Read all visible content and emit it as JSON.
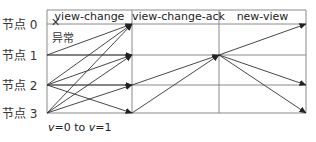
{
  "diagram": {
    "type": "pbft-view-change-sequence",
    "phases": [
      {
        "label": "view-change",
        "x_start": 47,
        "x_end": 132
      },
      {
        "label": "view-change-ack",
        "x_start": 132,
        "x_end": 219
      },
      {
        "label": "new-view",
        "x_start": 219,
        "x_end": 306
      }
    ],
    "nodes": [
      {
        "label": "节点 0",
        "y": 24,
        "faulty": true
      },
      {
        "label": "节点 1",
        "y": 55,
        "faulty": false
      },
      {
        "label": "节点 2",
        "y": 85,
        "faulty": false
      },
      {
        "label": "节点 3",
        "y": 113,
        "faulty": false
      }
    ],
    "fault_mark": "✕",
    "fault_label": "异常",
    "footer": {
      "v_from_var": "v",
      "v_from": "=0",
      "to": "to",
      "v_to_var": "v",
      "v_to": "=1"
    },
    "messages": [
      {
        "phase": "view-change",
        "from": 1,
        "to": 0
      },
      {
        "phase": "view-change",
        "from": 1,
        "to": 1
      },
      {
        "phase": "view-change",
        "from": 2,
        "to": 0
      },
      {
        "phase": "view-change",
        "from": 2,
        "to": 1
      },
      {
        "phase": "view-change",
        "from": 2,
        "to": 2
      },
      {
        "phase": "view-change",
        "from": 2,
        "to": 3
      },
      {
        "phase": "view-change",
        "from": 3,
        "to": 0
      },
      {
        "phase": "view-change",
        "from": 3,
        "to": 1
      },
      {
        "phase": "view-change",
        "from": 3,
        "to": 2
      },
      {
        "phase": "view-change-ack",
        "from": 2,
        "to": 1
      },
      {
        "phase": "view-change-ack",
        "from": 3,
        "to": 1
      },
      {
        "phase": "new-view",
        "from": 1,
        "to": 0
      },
      {
        "phase": "new-view",
        "from": 1,
        "to": 2
      },
      {
        "phase": "new-view",
        "from": 1,
        "to": 3
      }
    ]
  }
}
